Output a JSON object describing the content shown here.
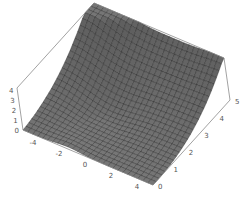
{
  "chart_data": {
    "type": "surface3d",
    "title": "",
    "xlabel": "",
    "ylabel": "",
    "zlabel": "",
    "x_range": [
      -5,
      5
    ],
    "y_range": [
      0,
      5
    ],
    "z_range": [
      0,
      4.3
    ],
    "x_ticks": [
      "-4",
      "-2",
      "0",
      "2",
      "4"
    ],
    "y_ticks": [
      "0",
      "1",
      "2",
      "3",
      "4",
      "5"
    ],
    "z_ticks": [
      "0",
      "1",
      "2",
      "3",
      "4"
    ],
    "grid_lines": 26,
    "surface_color": "#7a7a7a",
    "mesh_color": "#1a1a1a",
    "box_color": "#8a8a8a"
  },
  "colors": {
    "background": "#ffffff",
    "tick_text": "#555555"
  }
}
